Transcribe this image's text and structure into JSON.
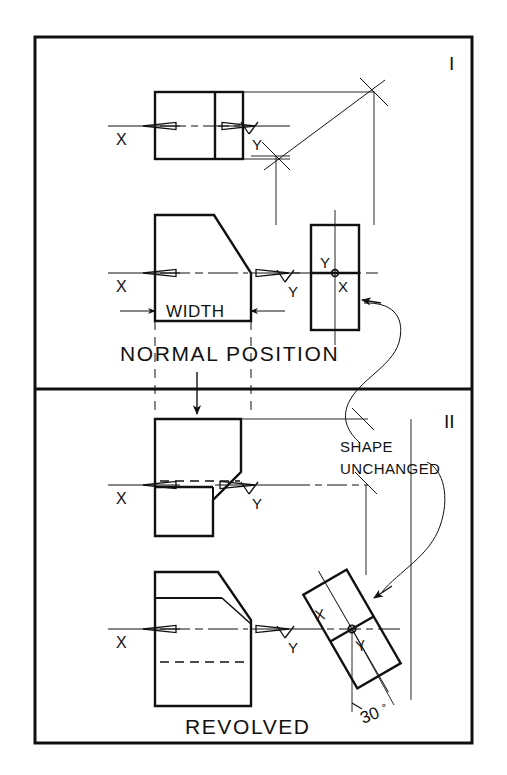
{
  "drawing": {
    "title_visible": false,
    "frame": {
      "x": 35,
      "y": 37,
      "width": 437,
      "height": 706
    },
    "divider_y": 389,
    "line_color": "#111111",
    "background_color": "#ffffff"
  },
  "panels": [
    {
      "id": "panel-1",
      "numeral": "I",
      "numeral_x": 449,
      "numeral_y": 68,
      "caption": "NORMAL POSITION",
      "caption_x": 120,
      "caption_y": 361
    },
    {
      "id": "panel-2",
      "numeral": "II",
      "numeral_x": 446,
      "numeral_y": 425,
      "caption": "REVOLVED",
      "caption_x": 185,
      "caption_y": 731
    }
  ],
  "labels": {
    "width": "WIDTH",
    "shape": "SHAPE",
    "unchanged": "UNCHANGED",
    "angle": "30",
    "angle_unit": "°",
    "axis_x": "X",
    "axis_y": "Y"
  },
  "axis_marks": [
    {
      "view": "top-view-normal",
      "x_label": "X",
      "y_label": "Y",
      "cy": 126
    },
    {
      "view": "front-view-normal",
      "x_label": "X",
      "y_label": "Y",
      "cy": 273
    },
    {
      "view": "side-view-normal",
      "x_label": "X",
      "y_label": "Y",
      "cy": 273
    },
    {
      "view": "top-view-revolved",
      "x_label": "X",
      "y_label": "Y",
      "cy": 485
    },
    {
      "view": "front-view-revolved",
      "x_label": "X",
      "y_label": "Y",
      "cy": 629
    },
    {
      "view": "side-view-revolved",
      "x_label": "X",
      "y_label": "Y",
      "cy": 629
    }
  ],
  "views": {
    "top_normal": {
      "x": 155,
      "y": 92,
      "w": 88,
      "h": 67,
      "rib_x": 215
    },
    "front_normal": {
      "x": 155,
      "y": 215,
      "w": 96,
      "h": 106,
      "chamfer": true
    },
    "side_normal": {
      "x": 311,
      "y": 225,
      "w": 48,
      "h": 105,
      "split_y": 273
    },
    "top_revolved": {
      "x": 155,
      "y": 419,
      "w": 86,
      "h": 117
    },
    "front_revolved": {
      "x": 155,
      "y": 572,
      "w": 96,
      "h": 134
    },
    "side_revolved": {
      "cx": 352,
      "cy": 629,
      "w": 50,
      "h": 108,
      "rotation": -30
    }
  },
  "annotations": {
    "miter_line": {
      "x1": 272,
      "y1": 156,
      "x2": 375,
      "y2": 90
    },
    "down_arrow": {
      "x": 197,
      "y1": 372,
      "y2": 412
    },
    "leader_curve_1": "normal-side-view-to-shape-unchanged",
    "leader_curve_2": "shape-unchanged-to-revolved-side-view"
  }
}
